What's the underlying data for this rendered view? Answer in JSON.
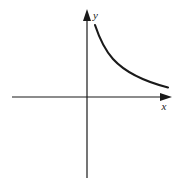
{
  "figure": {
    "title": "",
    "background_color": "#ffffff",
    "ink_color": "#1a1a1a",
    "width": 181,
    "height": 184
  },
  "axes": {
    "x_label": "x",
    "y_label": "y",
    "x_axis_name": "horizontal-axis",
    "y_axis_name": "vertical-axis",
    "origin": {
      "x": 87,
      "y": 97
    },
    "x_start": 12,
    "x_end": 172,
    "y_top": 10,
    "y_bottom": 178,
    "arrow_x": "x-axis-arrowhead",
    "arrow_y": "y-axis-arrowhead"
  },
  "chart_data": {
    "type": "line",
    "title": "",
    "subtitle": "",
    "xlabel": "x",
    "ylabel": "y",
    "grid": false,
    "legend": null,
    "axis_style": "cartesian-arrows",
    "series": [
      {
        "name": "decaying-curve",
        "description": "monotonically decreasing convex curve approaching the x-axis asymptotically",
        "color": "#1a1a1a",
        "stroke_width": 2.1,
        "points_px": [
          [
            95,
            25
          ],
          [
            98,
            33
          ],
          [
            102,
            42
          ],
          [
            107,
            50
          ],
          [
            113,
            58
          ],
          [
            120,
            65
          ],
          [
            128,
            71
          ],
          [
            137,
            77
          ],
          [
            147,
            82
          ],
          [
            157,
            85
          ],
          [
            168,
            88
          ]
        ],
        "path_d": "M 95 25 C 99 37, 104 49, 113 59 C 123 70, 139 80, 168 87.5"
      }
    ],
    "xlim": [
      12,
      172
    ],
    "ylim": [
      178,
      10
    ],
    "xticks": [],
    "yticks": [],
    "xticklabels": [],
    "yticklabels": [],
    "annotations": []
  }
}
